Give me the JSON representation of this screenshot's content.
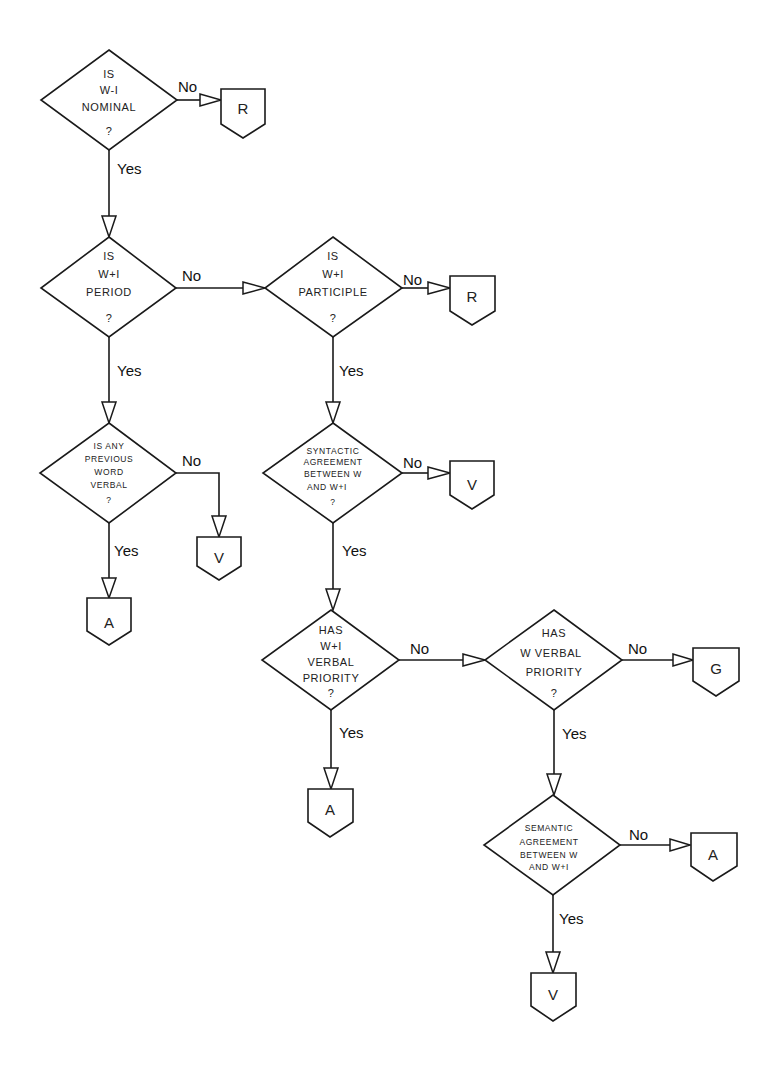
{
  "diagram": {
    "type": "flowchart",
    "decisions": [
      {
        "id": "d1",
        "lines": [
          "IS",
          "W-I",
          "NOMINAL",
          "?"
        ]
      },
      {
        "id": "d2",
        "lines": [
          "IS",
          "W+I",
          "PERIOD",
          "?"
        ]
      },
      {
        "id": "d3",
        "lines": [
          "IS",
          "W+I",
          "PARTICIPLE",
          "?"
        ]
      },
      {
        "id": "d4",
        "lines": [
          "IS ANY",
          "PREVIOUS",
          "WORD",
          "VERBAL",
          "?"
        ]
      },
      {
        "id": "d5",
        "lines": [
          "SYNTACTIC",
          "AGREEMENT",
          "BETWEEN  W",
          "AND  W+I",
          "?"
        ]
      },
      {
        "id": "d6",
        "lines": [
          "HAS",
          "W+I",
          "VERBAL",
          "PRIORITY",
          "?"
        ]
      },
      {
        "id": "d7",
        "lines": [
          "HAS",
          "W VERBAL",
          "PRIORITY",
          "?"
        ]
      },
      {
        "id": "d8",
        "lines": [
          "SEMANTIC",
          "AGREEMENT",
          "BETWEEN  W",
          "AND  W+I"
        ]
      }
    ],
    "terminals": [
      {
        "id": "t1",
        "label": "R"
      },
      {
        "id": "t2",
        "label": "R"
      },
      {
        "id": "t3",
        "label": "V"
      },
      {
        "id": "t4",
        "label": "A"
      },
      {
        "id": "t5",
        "label": "V"
      },
      {
        "id": "t6",
        "label": "A"
      },
      {
        "id": "t7",
        "label": "G"
      },
      {
        "id": "t8",
        "label": "A"
      },
      {
        "id": "t9",
        "label": "V"
      }
    ],
    "edge_labels": {
      "yes": "Yes",
      "no": "No"
    },
    "edges": [
      {
        "from": "d1",
        "to": "t1",
        "label": "No"
      },
      {
        "from": "d1",
        "to": "d2",
        "label": "Yes"
      },
      {
        "from": "d2",
        "to": "d3",
        "label": "No"
      },
      {
        "from": "d2",
        "to": "d4",
        "label": "Yes"
      },
      {
        "from": "d3",
        "to": "t2",
        "label": "No"
      },
      {
        "from": "d3",
        "to": "d5",
        "label": "Yes"
      },
      {
        "from": "d4",
        "to": "t3",
        "label": "No"
      },
      {
        "from": "d4",
        "to": "t4",
        "label": "Yes"
      },
      {
        "from": "d5",
        "to": "t5",
        "label": "No"
      },
      {
        "from": "d5",
        "to": "d6",
        "label": "Yes"
      },
      {
        "from": "d6",
        "to": "d7",
        "label": "No"
      },
      {
        "from": "d6",
        "to": "t6",
        "label": "Yes"
      },
      {
        "from": "d7",
        "to": "t7",
        "label": "No"
      },
      {
        "from": "d7",
        "to": "d8",
        "label": "Yes"
      },
      {
        "from": "d8",
        "to": "t8",
        "label": "No"
      },
      {
        "from": "d8",
        "to": "t9",
        "label": "Yes"
      }
    ]
  }
}
